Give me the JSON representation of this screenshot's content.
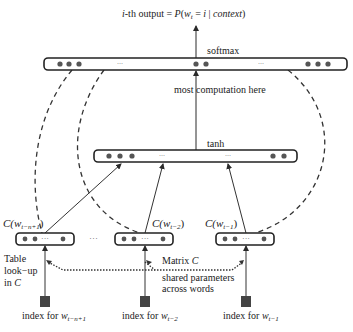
{
  "title": {
    "prefix_italic": "i",
    "prefix_rest": "-th output = ",
    "formula_P": "P",
    "formula_open": "(",
    "formula_w": "w",
    "formula_sub": "t",
    "formula_eq": " = ",
    "formula_i": "i",
    "formula_bar": " | ",
    "formula_context": "context",
    "formula_close": ")"
  },
  "layers": {
    "softmax": {
      "label": "softmax",
      "ellipsis_left": "...",
      "ellipsis_right": "..."
    },
    "annotation_middle": "most computation here",
    "tanh": {
      "label": "tanh",
      "ellipsis_left": "...",
      "ellipsis_right": "..."
    }
  },
  "embeddings": [
    {
      "label_C": "C(",
      "label_w": "w",
      "label_sub": "t−n+1",
      "label_close": ")",
      "ellipsis": "···"
    },
    {
      "label_C": "C(",
      "label_w": "w",
      "label_sub": "t−2",
      "label_close": ")",
      "ellipsis": "···"
    },
    {
      "label_C": "C(",
      "label_w": "w",
      "label_sub": "t−1",
      "label_close": ")",
      "ellipsis": "···"
    }
  ],
  "between_embeddings_ellipsis": "···",
  "annotations": {
    "table_lookup_line1": "Table",
    "table_lookup_line2": "look−up",
    "table_lookup_line3_prefix": "in ",
    "table_lookup_line3_var": "C",
    "matrix_prefix": "Matrix ",
    "matrix_var": "C",
    "shared_line1": "shared parameters",
    "shared_line2": "across words"
  },
  "inputs": [
    {
      "prefix": "index for ",
      "w": "w",
      "sub": "t−n+1"
    },
    {
      "prefix": "index for ",
      "w": "w",
      "sub": "t−2"
    },
    {
      "prefix": "index for ",
      "w": "w",
      "sub": "t−1"
    }
  ],
  "colors": {
    "stroke": "#2a2a2a",
    "dot": "#555555",
    "square": "#444444"
  }
}
